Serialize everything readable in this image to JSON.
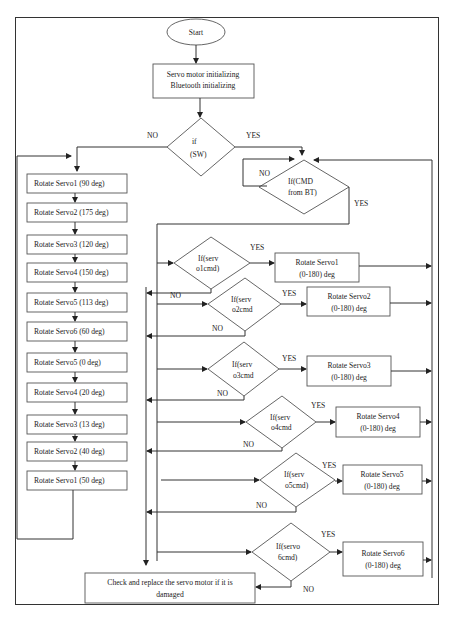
{
  "start": "Start",
  "init": [
    "Servo motor initializing",
    "Bluetooth initializing"
  ],
  "sw_decision": [
    "if",
    "(SW)"
  ],
  "sw_no": "NO",
  "sw_yes": "YES",
  "cmd_decision": [
    "If(CMD",
    "from BT)"
  ],
  "cmd_no": "NO",
  "cmd_yes": "YES",
  "sequence": [
    "Rotate Servo1 (90 deg)",
    "Rotate Servo2 (175 deg)",
    "Rotate Servo3 (120 deg)",
    "Rotate Servo4 (150 deg)",
    "Rotate Servo5 (113 deg)",
    "Rotate Servo6 (60 deg)",
    "Rotate Servo5 (0 deg)",
    "Rotate Servo4 (20 deg)",
    "Rotate Servo3 (13 deg)",
    "Rotate Servo2 (40 deg)",
    "Rotate Servo1 (50 deg)"
  ],
  "servo_checks": [
    {
      "cond": [
        "If(serv",
        "o1cmd)"
      ],
      "action": [
        "Rotate Servo1",
        "(0-180) deg"
      ],
      "yes": "YES",
      "no": "NO"
    },
    {
      "cond": [
        "If(serv",
        "o2cmd"
      ],
      "action": [
        "Rotate Servo2",
        "(0-180) deg"
      ],
      "yes": "YES",
      "no": "NO"
    },
    {
      "cond": [
        "If(serv",
        "o3cmd"
      ],
      "action": [
        "Rotate Servo3",
        "(0-180) deg"
      ],
      "yes": "YES",
      "no": "NO"
    },
    {
      "cond": [
        "If(serv",
        "o4cmd"
      ],
      "action": [
        "Rotate Servo4",
        "(0-180) deg"
      ],
      "yes": "YES",
      "no": "NO"
    },
    {
      "cond": [
        "If(serv",
        "o5cmd)"
      ],
      "action": [
        "Rotate Servo5",
        "(0-180) deg"
      ],
      "yes": "YES",
      "no": "NO"
    },
    {
      "cond": [
        "If(servo",
        "6cmd)"
      ],
      "action": [
        "Rotate Servo6",
        "(0-180) deg"
      ],
      "yes": "YES",
      "no": "NO"
    }
  ],
  "final": [
    "Check and replace the servo motor if it is",
    "damaged"
  ]
}
